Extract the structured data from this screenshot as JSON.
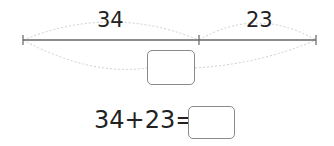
{
  "diagram": {
    "segments": [
      {
        "label": "34"
      },
      {
        "label": "23"
      }
    ],
    "total_box": ""
  },
  "equation": {
    "expression": "34+23=",
    "answer": ""
  }
}
